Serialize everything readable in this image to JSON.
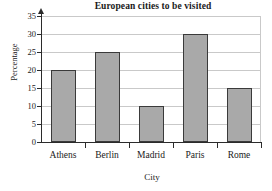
{
  "chart_data": {
    "type": "bar",
    "title": "European cities to be visited",
    "xlabel": "City",
    "ylabel": "Percentage",
    "categories": [
      "Athens",
      "Berlin",
      "Madrid",
      "Paris",
      "Rome"
    ],
    "values": [
      20,
      25,
      10,
      30,
      15
    ],
    "yticks": [
      0,
      5,
      10,
      15,
      20,
      25,
      30,
      35
    ],
    "ylim": [
      0,
      35
    ],
    "grid": "horizontal",
    "legend": "none",
    "bar_color": "#a9a9a9",
    "bar_border_color": "#3a3a3a",
    "gridline_color": "#c9c9c9",
    "axis_color": "#2b2b2b"
  }
}
